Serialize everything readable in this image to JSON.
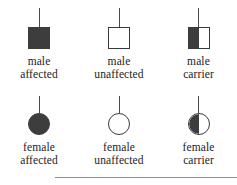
{
  "figure": {
    "name": "pedigree-symbol-legend",
    "background_color": "#ffffff",
    "symbol_fill_color": "#3d3d3d",
    "symbol_outline_color": "#3a3a3a",
    "connector_color": "#4a4a4a",
    "text_color": "#1c1c1c",
    "rule_color": "#8e8e8e"
  },
  "rows": [
    {
      "sex": "male",
      "shape": "square",
      "entries": [
        {
          "icon": "filled-square-icon",
          "fill": "full",
          "label_line1": "male",
          "label_line2": "affected"
        },
        {
          "icon": "empty-square-icon",
          "fill": "none",
          "label_line1": "male",
          "label_line2": "unaffected"
        },
        {
          "icon": "half-filled-square-icon",
          "fill": "half",
          "label_line1": "male",
          "label_line2": "carrier"
        }
      ]
    },
    {
      "sex": "female",
      "shape": "circle",
      "entries": [
        {
          "icon": "filled-circle-icon",
          "fill": "full",
          "label_line1": "female",
          "label_line2": "affected"
        },
        {
          "icon": "empty-circle-icon",
          "fill": "none",
          "label_line1": "female",
          "label_line2": "unaffected"
        },
        {
          "icon": "half-filled-circle-icon",
          "fill": "half",
          "label_line1": "female",
          "label_line2": "carrier"
        }
      ]
    }
  ]
}
